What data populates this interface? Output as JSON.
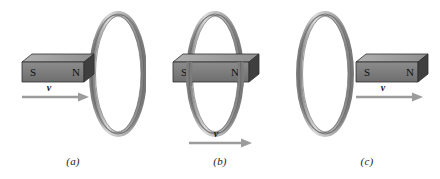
{
  "figure": {
    "background_color": "#ffffff",
    "panels": [
      {
        "id": "a",
        "caption": "(a)",
        "description": "Bar magnet at left approaching the ring at right, north pole leading",
        "magnet": {
          "south_label": "S",
          "north_label": "N",
          "front_color": "#7d7d7d",
          "top_color": "#a3a3a3",
          "end_color": "#3c3c3c",
          "outline_color": "#2b2b2b"
        },
        "velocity": {
          "label": "v",
          "direction": "right",
          "arrow_color": "#9a9a9a"
        },
        "ring": {
          "band_color": "#c9c9c9",
          "shade_color": "#8e8e8e",
          "outline_color": "#5a5a5a",
          "position": "right"
        }
      },
      {
        "id": "b",
        "caption": "(b)",
        "description": "Bar magnet passing through the center of the ring",
        "magnet": {
          "south_label": "S",
          "north_label": "N",
          "front_color": "#7d7d7d",
          "top_color": "#a3a3a3",
          "end_color": "#3c3c3c",
          "outline_color": "#2b2b2b"
        },
        "velocity": {
          "label": "v",
          "direction": "right",
          "arrow_color": "#9a9a9a"
        },
        "ring": {
          "band_color": "#c9c9c9",
          "shade_color": "#8e8e8e",
          "outline_color": "#5a5a5a",
          "position": "center"
        }
      },
      {
        "id": "c",
        "caption": "(c)",
        "description": "Bar magnet at right having passed beyond the ring at left",
        "magnet": {
          "south_label": "S",
          "north_label": "N",
          "front_color": "#7d7d7d",
          "top_color": "#a3a3a3",
          "end_color": "#3c3c3c",
          "outline_color": "#2b2b2b"
        },
        "velocity": {
          "label": "v",
          "direction": "right",
          "arrow_color": "#9a9a9a"
        },
        "ring": {
          "band_color": "#c9c9c9",
          "shade_color": "#8e8e8e",
          "outline_color": "#5a5a5a",
          "position": "left"
        }
      }
    ]
  }
}
